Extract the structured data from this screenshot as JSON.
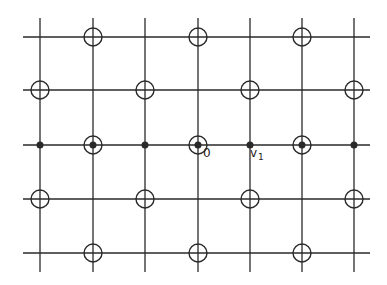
{
  "diagram": {
    "type": "lattice",
    "stroke_color": "#2a2a2a",
    "grid": {
      "x_lines": [
        40,
        93,
        145,
        198,
        250,
        302,
        354
      ],
      "y_lines": [
        37,
        90,
        145,
        199,
        253
      ],
      "x_extent": [
        23,
        370
      ],
      "y_extent": [
        18,
        272
      ]
    },
    "circle_radius": 9,
    "dot_radius": 3.5,
    "open_circles": [
      [
        93,
        37
      ],
      [
        198,
        37
      ],
      [
        302,
        37
      ],
      [
        40,
        90
      ],
      [
        145,
        90
      ],
      [
        250,
        90
      ],
      [
        354,
        90
      ],
      [
        93,
        145
      ],
      [
        198,
        145
      ],
      [
        302,
        145
      ],
      [
        40,
        199
      ],
      [
        145,
        199
      ],
      [
        250,
        199
      ],
      [
        354,
        199
      ],
      [
        93,
        253
      ],
      [
        198,
        253
      ],
      [
        302,
        253
      ]
    ],
    "filled_dots": [
      [
        40,
        145
      ],
      [
        93,
        145
      ],
      [
        145,
        145
      ],
      [
        198,
        145
      ],
      [
        250,
        145
      ],
      [
        302,
        145
      ],
      [
        354,
        145
      ]
    ],
    "labels": [
      {
        "text": "0",
        "x": 203,
        "y": 148
      },
      {
        "text": "v",
        "x": 250,
        "y": 148
      },
      {
        "text": "1",
        "x": 259,
        "y": 155
      }
    ]
  }
}
